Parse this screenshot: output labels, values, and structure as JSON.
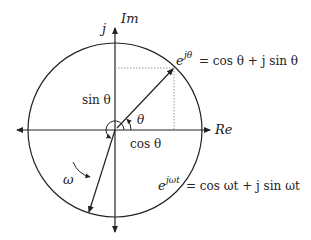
{
  "diagram": {
    "axes": {
      "imaginary_label": "Im",
      "j_label": "j",
      "real_label": "Re"
    },
    "labels": {
      "sin_theta": "sin θ",
      "cos_theta": "cos θ",
      "theta": "θ",
      "omega": "ω"
    },
    "equations": {
      "euler_theta_base": "e",
      "euler_theta_exp": "jθ",
      "euler_theta_rhs": "= cos θ + j sin θ",
      "euler_omega_base": "e",
      "euler_omega_exp": "jωt",
      "euler_omega_rhs": "= cos ωt + j sin ωt"
    },
    "colors": {
      "stroke": "#222222",
      "dotted": "#888888",
      "background": "#ffffff"
    }
  }
}
